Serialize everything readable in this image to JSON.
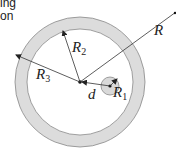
{
  "caption": {
    "line1": "ing",
    "line2": "on"
  },
  "diagram": {
    "labels": {
      "R": "R",
      "R1": "R",
      "R1_sub": "1",
      "R2": "R",
      "R2_sub": "2",
      "R3": "R",
      "R3_sub": "3",
      "d": "d"
    },
    "colors": {
      "ring_fill": "#dcdcdc",
      "ring_stroke": "#888888",
      "small_circle_fill": "#d9d9d9",
      "line": "#333333"
    }
  }
}
